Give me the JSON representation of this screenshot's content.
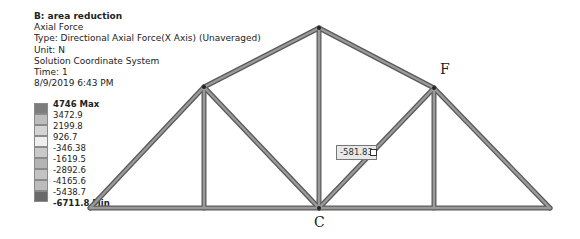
{
  "info": {
    "title": "B: area reduction",
    "result": "Axial Force",
    "type": "Type: Directional Axial Force(X Axis) (Unaveraged)",
    "unit": "Unit: N",
    "coord": "Solution Coordinate System",
    "time": "Time: 1",
    "date": "8/9/2019 6:43 PM"
  },
  "legend": {
    "labels": [
      "4746 Max",
      "3472.9",
      "2199.8",
      "926.7",
      "-346.38",
      "-1619.5",
      "-2892.6",
      "-4165.6",
      "-5438.7",
      "-6711.8 Min"
    ],
    "colors": [
      "#7d7d7d",
      "#bdbdbd",
      "#d4d4d4",
      "#eeeeee",
      "#c9c9c9",
      "#b4b4b4",
      "#c3c3c3",
      "#bcbcbc",
      "#b0b0b0",
      "#6a6a6a"
    ]
  },
  "nodes": {
    "F": "F",
    "C": "C"
  },
  "callout": {
    "value": "-581.83"
  },
  "truss": {
    "member_color": "#8c8c8c",
    "member_edge": "#5a5a5a",
    "points": {
      "left_support": [
        90,
        208
      ],
      "right_support": [
        550,
        208
      ],
      "apex": [
        319,
        28
      ],
      "left_panel": [
        204,
        87
      ],
      "right_panel": [
        434,
        88
      ],
      "left_bottom": [
        204,
        208
      ],
      "center_bottom": [
        319,
        208
      ],
      "right_bottom": [
        434,
        208
      ]
    }
  }
}
